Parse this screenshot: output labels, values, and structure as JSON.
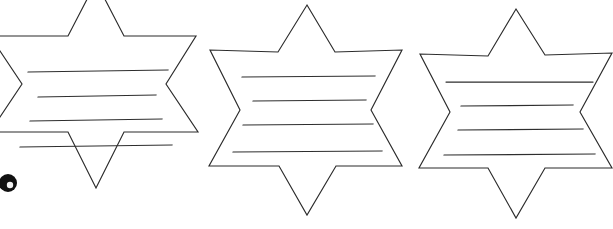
{
  "page": {
    "width": 613,
    "height": 229,
    "background_color": "#ffffff",
    "ink_color": "#2b2b2b",
    "caption": "Three hand-drawn six-pointed star outlines in a row, each containing four horizontal ruled writing lines. A small dark circular scan artifact sits at the left edge."
  },
  "artifact": {
    "name": "scan-blob",
    "label": "Dark circular scan artifact",
    "center_x": 8,
    "center_y": 183,
    "outer_radius": 9,
    "inner_radius": 3.2,
    "outer_color": "#111111",
    "inner_color": "#f2f2f2"
  },
  "stars": [
    {
      "id": "star-1",
      "label": "Six-pointed star 1",
      "clipped": "left and top edges",
      "outline_points": "96,-18 124,36 196,36 166,84 198,132 124,132 96,188 68,132 -10,132 22,84 -10,36 68,36",
      "lines": [
        {
          "id": "line-1",
          "label": "Writing line 1",
          "x1": 28,
          "y1": 72,
          "x2": 168,
          "y2": 70
        },
        {
          "id": "line-2",
          "label": "Writing line 2",
          "x1": 38,
          "y1": 97,
          "x2": 156,
          "y2": 95
        },
        {
          "id": "line-3",
          "label": "Writing line 3",
          "x1": 30,
          "y1": 121,
          "x2": 162,
          "y2": 119
        },
        {
          "id": "line-4",
          "label": "Writing line 4",
          "x1": 20,
          "y1": 147,
          "x2": 172,
          "y2": 145
        }
      ]
    },
    {
      "id": "star-2",
      "label": "Six-pointed star 2",
      "clipped": "none",
      "outline_points": "307,5 335,52 402,50 371,110 402,166 336,166 307,215 279,166 209,166 240,110 210,50 278,52",
      "lines": [
        {
          "id": "line-1",
          "label": "Writing line 1",
          "x1": 242,
          "y1": 77,
          "x2": 375,
          "y2": 76
        },
        {
          "id": "line-2",
          "label": "Writing line 2",
          "x1": 253,
          "y1": 101,
          "x2": 366,
          "y2": 100
        },
        {
          "id": "line-3",
          "label": "Writing line 3",
          "x1": 243,
          "y1": 125,
          "x2": 373,
          "y2": 124
        },
        {
          "id": "line-4",
          "label": "Writing line 4",
          "x1": 233,
          "y1": 152,
          "x2": 382,
          "y2": 151
        }
      ]
    },
    {
      "id": "star-3",
      "label": "Six-pointed star 3",
      "clipped": "right edge",
      "outline_points": "516,9 545,55 612,53 580,112 612,168 545,168 516,218 488,168 419,168 450,112 420,54 488,56",
      "lines": [
        {
          "id": "line-1",
          "label": "Writing line 1",
          "x1": 446,
          "y1": 82,
          "x2": 593,
          "y2": 82
        },
        {
          "id": "line-2",
          "label": "Writing line 2",
          "x1": 461,
          "y1": 106,
          "x2": 573,
          "y2": 105
        },
        {
          "id": "line-3",
          "label": "Writing line 3",
          "x1": 458,
          "y1": 130,
          "x2": 583,
          "y2": 129
        },
        {
          "id": "line-4",
          "label": "Writing line 4",
          "x1": 444,
          "y1": 155,
          "x2": 595,
          "y2": 154
        }
      ]
    }
  ]
}
